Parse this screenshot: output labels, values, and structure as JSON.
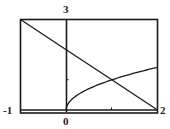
{
  "chart_data": {
    "type": "line",
    "title": "",
    "xlabel": "",
    "ylabel": "",
    "xlim": [
      -1,
      2
    ],
    "ylim": [
      0,
      3
    ],
    "grid": false,
    "legend": null,
    "tick_labels": {
      "x_min": "-1",
      "x_zero": "0",
      "x_max": "2",
      "y_max": "3"
    },
    "ticks": {
      "x": [
        1
      ],
      "y": [
        1
      ]
    },
    "series": [
      {
        "name": "y = 2 - x",
        "x": [
          -1,
          0,
          1,
          2
        ],
        "values": [
          3,
          2,
          1,
          0
        ]
      },
      {
        "name": "y = sqrt(x)",
        "x": [
          0,
          0.1,
          0.25,
          0.5,
          0.75,
          1,
          1.25,
          1.5,
          1.75,
          2
        ],
        "values": [
          0,
          0.316,
          0.5,
          0.707,
          0.866,
          1,
          1.118,
          1.225,
          1.323,
          1.414
        ]
      }
    ],
    "annotations": [
      {
        "text": "intersection",
        "x": 1,
        "y": 1
      }
    ]
  },
  "colors": {
    "ink": "#1a1a1a",
    "background": "#ffffff"
  }
}
